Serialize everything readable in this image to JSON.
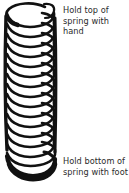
{
  "figure": {
    "ink_color": "#111111",
    "background_color": "#ffffff",
    "coil_turns": 16,
    "orientation": "vertical",
    "top_end": "free end of wire curling up and to the right",
    "bottom_end": "closed thicker coil resting at base"
  },
  "captions": {
    "top": "Hold top of\nspring with\nhand",
    "bottom": "Hold bottom of\nspring with foot"
  }
}
